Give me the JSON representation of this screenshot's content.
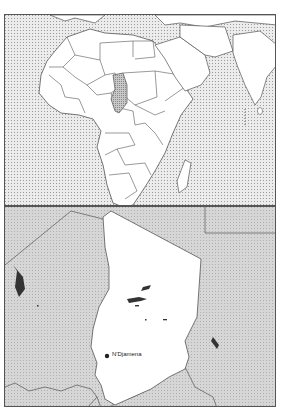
{
  "locator_map": {
    "region": "Africa",
    "highlighted_country": "Chad",
    "colors": {
      "ocean": "#d9d9d9",
      "land": "#ffffff",
      "highlight": "#bdbdbd",
      "border": "#555555"
    }
  },
  "detail_map": {
    "country": "Chad",
    "capital": {
      "name": "N'Djamena"
    },
    "colors": {
      "country": "#ffffff",
      "neighbors": "#cfcfcf",
      "border": "#555555"
    }
  }
}
